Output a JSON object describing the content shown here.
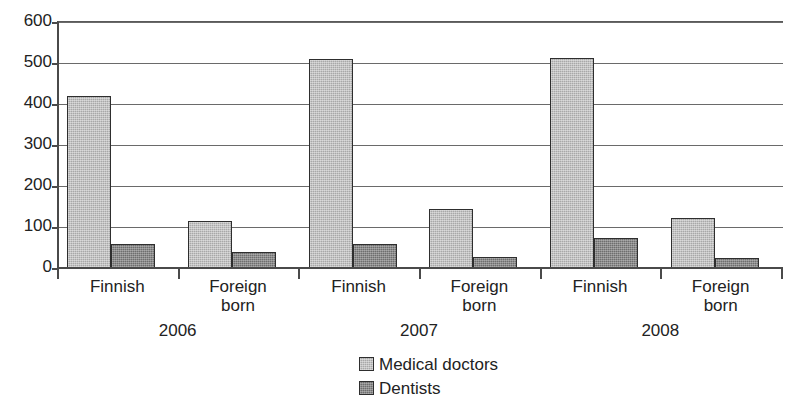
{
  "chart_data": {
    "type": "bar",
    "title": "",
    "subtitle": "",
    "xlabel": "",
    "ylabel": "",
    "ylim": [
      0,
      600
    ],
    "ytick_values": [
      0,
      100,
      200,
      300,
      400,
      500,
      600
    ],
    "ytick_labels": [
      "0",
      "100",
      "200",
      "300",
      "400",
      "500",
      "600"
    ],
    "grid": true,
    "grid_axis": "y",
    "legend_position": "bottom-center",
    "group_labels": [
      "2006",
      "2007",
      "2008"
    ],
    "categories": [
      "Finnish",
      "Foreign born",
      "Finnish",
      "Foreign born",
      "Finnish",
      "Foreign born"
    ],
    "category_lines": [
      [
        "Finnish"
      ],
      [
        "Foreign",
        "born"
      ],
      [
        "Finnish"
      ],
      [
        "Foreign",
        "born"
      ],
      [
        "Finnish"
      ],
      [
        "Foreign",
        "born"
      ]
    ],
    "series": [
      {
        "name": "Medical doctors",
        "color": "#a8a8a8",
        "values": [
          420,
          115,
          510,
          145,
          513,
          122
        ]
      },
      {
        "name": "Dentists",
        "color": "#6e6e6e",
        "values": [
          58,
          40,
          58,
          28,
          72,
          25
        ]
      }
    ],
    "groups": [
      {
        "year": "2006",
        "bars": [
          {
            "category": "Finnish",
            "Medical doctors": 420,
            "Dentists": 58
          },
          {
            "category": "Foreign born",
            "Medical doctors": 115,
            "Dentists": 40
          }
        ]
      },
      {
        "year": "2007",
        "bars": [
          {
            "category": "Finnish",
            "Medical doctors": 510,
            "Dentists": 58
          },
          {
            "category": "Foreign born",
            "Medical doctors": 145,
            "Dentists": 28
          }
        ]
      },
      {
        "year": "2008",
        "bars": [
          {
            "category": "Finnish",
            "Medical doctors": 513,
            "Dentists": 72
          },
          {
            "category": "Foreign born",
            "Medical doctors": 122,
            "Dentists": 25
          }
        ]
      }
    ]
  },
  "legend": {
    "items": [
      {
        "label": "Medical doctors",
        "swatch": "doctors"
      },
      {
        "label": "Dentists",
        "swatch": "dentists"
      }
    ]
  }
}
